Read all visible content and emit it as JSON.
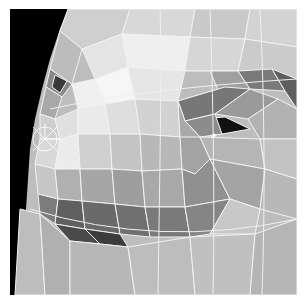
{
  "figure": {
    "background_color": "#000000",
    "edge_color": "#f2f2f2",
    "border_color": "#ffffff",
    "caption": ""
  }
}
